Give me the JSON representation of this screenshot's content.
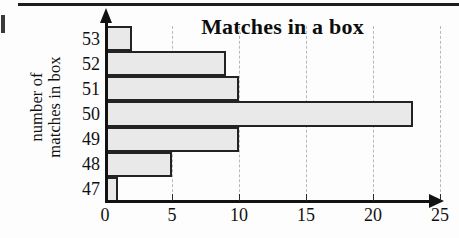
{
  "chart_data": {
    "type": "bar",
    "orientation": "horizontal",
    "title": "Matches in a box",
    "xlabel": "",
    "ylabel": "number of matches in box",
    "ylabel_lines": [
      "number of",
      "matches in box"
    ],
    "categories": [
      "47",
      "48",
      "49",
      "50",
      "51",
      "52",
      "53"
    ],
    "values": [
      1,
      5,
      10,
      23,
      10,
      9,
      2
    ],
    "xlim": [
      0,
      25
    ],
    "xticks": [
      0,
      5,
      10,
      15,
      20,
      25
    ],
    "xtick_labels": [
      "0",
      "5",
      "10",
      "15",
      "20",
      "25"
    ],
    "grid": "vertical-dashed",
    "legend": null,
    "bar_fill_color": "#e9e9e9",
    "bar_border_color": "#232323",
    "axis_color": "#121212",
    "gridline_color": "#b9b9b9"
  }
}
